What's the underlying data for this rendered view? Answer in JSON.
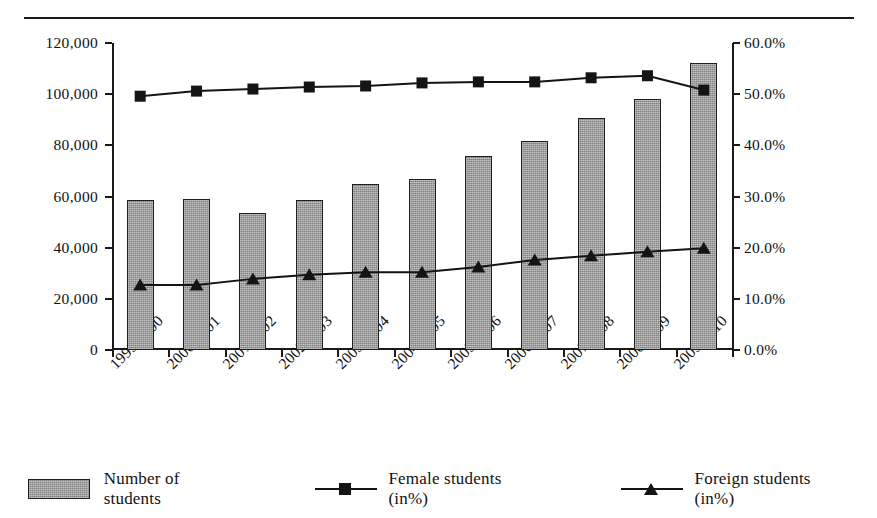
{
  "chart_data": {
    "type": "bar",
    "title": "",
    "subtitle": "",
    "xlabel": "",
    "ylabel": "",
    "grid": false,
    "legend_position": "bottom",
    "categories": [
      "1999/2000",
      "2000/2001",
      "2001/2002",
      "2002/2003",
      "2003/2004",
      "2004/2005",
      "2005/2006",
      "2006/2007",
      "2007/2008",
      "2008/2009",
      "2009/2010"
    ],
    "axes": {
      "left": {
        "label": "",
        "ylim": [
          0,
          120000
        ],
        "ticks": [
          0,
          20000,
          40000,
          60000,
          80000,
          100000,
          120000
        ],
        "tick_labels": [
          "0",
          "20,000",
          "40,000",
          "60,000",
          "80,000",
          "100,000",
          "120,000"
        ]
      },
      "right": {
        "label": "",
        "ylim": [
          0,
          60
        ],
        "ticks": [
          0,
          10,
          20,
          30,
          40,
          50,
          60
        ],
        "tick_labels": [
          "0.0%",
          "10.0%",
          "20.0%",
          "30.0%",
          "40.0%",
          "50.0%",
          "60.0%"
        ]
      }
    },
    "series": [
      {
        "name": "Number of students",
        "type": "bar",
        "axis": "left",
        "color": "#9d9d9d",
        "marker": "none",
        "values": [
          58500,
          59000,
          53500,
          58500,
          65000,
          67000,
          76000,
          81500,
          90500,
          98000,
          112000
        ]
      },
      {
        "name": "Female students (in%)",
        "type": "line",
        "axis": "right",
        "color": "#141414",
        "marker": "square",
        "values": [
          49.6,
          50.6,
          51.0,
          51.4,
          51.6,
          52.2,
          52.4,
          52.4,
          53.2,
          53.6,
          50.8
        ]
      },
      {
        "name": "Foreign students (in%)",
        "type": "line",
        "axis": "right",
        "color": "#141414",
        "marker": "triangle",
        "values": [
          12.7,
          12.7,
          13.9,
          14.7,
          15.2,
          15.2,
          16.2,
          17.6,
          18.4,
          19.2,
          19.9
        ]
      }
    ]
  },
  "legend": {
    "items": [
      {
        "label": "Number of students",
        "marker": "bar-swatch-icon"
      },
      {
        "label": "Female students (in%)",
        "marker": "line-square-marker-icon"
      },
      {
        "label": "Foreign students (in%)",
        "marker": "line-triangle-marker-icon"
      }
    ]
  }
}
